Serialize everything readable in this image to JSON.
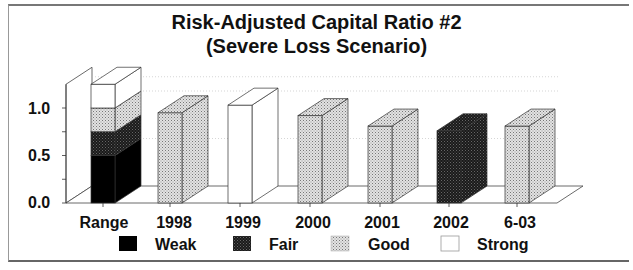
{
  "title": {
    "line1": "Risk-Adjusted Capital Ratio #2",
    "line2": "(Severe Loss Scenario)"
  },
  "chart_data": {
    "type": "bar",
    "style": "3d-column",
    "title": "Risk-Adjusted Capital Ratio #2 (Severe Loss Scenario)",
    "xlabel": "",
    "ylabel": "",
    "ylim": [
      0,
      1.25
    ],
    "yticks": [
      "0.0",
      "0.5",
      "1.0"
    ],
    "categories": [
      "Range",
      "1998",
      "1999",
      "2000",
      "2001",
      "2002",
      "6-03"
    ],
    "range_bands": [
      {
        "name": "Weak",
        "from": 0.0,
        "to": 0.5
      },
      {
        "name": "Fair",
        "from": 0.5,
        "to": 0.75
      },
      {
        "name": "Good",
        "from": 0.75,
        "to": 1.0
      },
      {
        "name": "Strong",
        "from": 1.0,
        "to": 1.25
      }
    ],
    "values": [
      null,
      0.95,
      1.03,
      0.92,
      0.81,
      0.76,
      0.81
    ],
    "value_rating": [
      null,
      "Good",
      "Strong",
      "Good",
      "Good",
      "Fair",
      "Good"
    ],
    "legend": [
      "Weak",
      "Fair",
      "Good",
      "Strong"
    ],
    "legend_position": "bottom",
    "grid": false
  },
  "legend": {
    "items": [
      {
        "label": "Weak"
      },
      {
        "label": "Fair"
      },
      {
        "label": "Good"
      },
      {
        "label": "Strong"
      }
    ]
  },
  "colors": {
    "weak": "#000000",
    "fair": "#2a2a2a",
    "good": "#c8c8c8",
    "strong": "#ffffff"
  }
}
